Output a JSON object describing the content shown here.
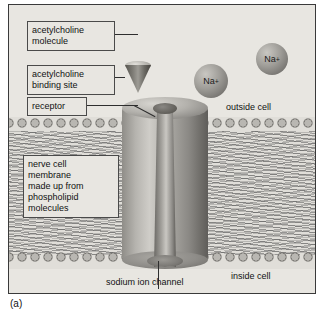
{
  "figure": {
    "caption": "(a)",
    "labels": {
      "acetylcholine_molecule": "acetylcholine\nmolecule",
      "acetylcholine_binding_site": "acetylcholine\nbinding site",
      "receptor": "receptor",
      "outside_cell": "outside cell",
      "membrane_block": "nerve cell\nmembrane\nmade up from\nphospholipid\nmolecules",
      "inside_cell": "inside cell",
      "sodium_ion_channel": "sodium ion channel"
    },
    "ions": [
      {
        "label": "Na",
        "charge": "+"
      },
      {
        "label": "Na",
        "charge": "+"
      }
    ],
    "colors": {
      "background": "#e8e6e1",
      "border": "#3a3a3a",
      "protein": "#a7a5a0",
      "ion": "#9e9c97",
      "text": "#111111"
    }
  }
}
